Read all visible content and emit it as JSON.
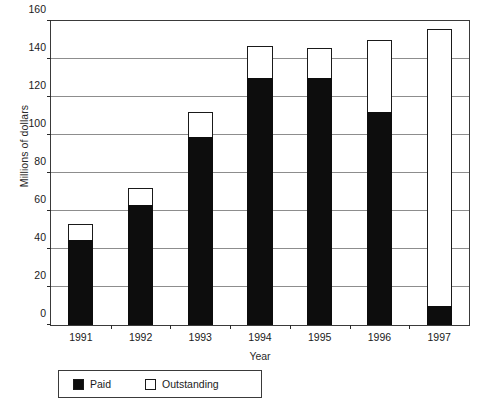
{
  "chart_data": {
    "type": "bar",
    "subtype": "stacked-bar",
    "title": "",
    "xlabel": "Year",
    "ylabel": "Millions of dollars",
    "categories": [
      "1991",
      "1992",
      "1993",
      "1994",
      "1995",
      "1996",
      "1997"
    ],
    "series": [
      {
        "name": "Paid",
        "color": "#0d0d0d",
        "values": [
          45,
          63,
          99,
          130,
          130,
          112,
          10
        ]
      },
      {
        "name": "Outstanding",
        "color": "#ffffff",
        "values": [
          8,
          9,
          13,
          17,
          16,
          38,
          146
        ]
      }
    ],
    "totals": [
      53,
      72,
      112,
      147,
      146,
      150,
      156
    ],
    "ylim": [
      0,
      160
    ],
    "yticks": [
      0,
      20,
      40,
      60,
      80,
      100,
      120,
      140,
      160
    ],
    "ytick_labels": [
      "0",
      "20",
      "40",
      "60",
      "80",
      "100",
      "120",
      "140",
      "160"
    ],
    "grid": "horizontal",
    "legend_position": "bottom-left",
    "legend_entries": [
      "Paid",
      "Outstanding"
    ]
  }
}
